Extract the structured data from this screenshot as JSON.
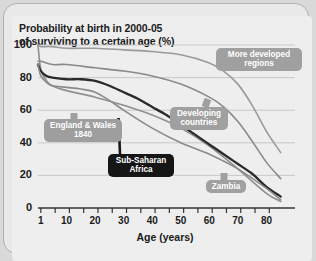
{
  "chart_data": {
    "type": "line",
    "title": "Probability at birth in 2000-05 of surviving to a certain age (%)",
    "title_line1": "Probability at birth in 2000-05",
    "title_line2": "of surviving to a certain age (%)",
    "xlabel": "Age (years)",
    "ylabel": "",
    "xlim": [
      0,
      90
    ],
    "ylim": [
      0,
      100
    ],
    "grid": true,
    "legend_position": "inline-callouts",
    "yticks": [
      0,
      20,
      40,
      60,
      80,
      100
    ],
    "ytick_labels": [
      "0",
      "20",
      "40",
      "60",
      "80",
      "100"
    ],
    "xticks": [
      1,
      10,
      20,
      30,
      40,
      50,
      60,
      70,
      80
    ],
    "xtick_labels": [
      "1",
      "10",
      "20",
      "30",
      "40",
      "50",
      "60",
      "70",
      "80"
    ],
    "series": [
      {
        "name": "More developed regions",
        "color": "#9a9a9a",
        "width": 1.6,
        "x": [
          0,
          1,
          5,
          10,
          20,
          30,
          40,
          50,
          60,
          65,
          70,
          75,
          80,
          85
        ],
        "values": [
          100,
          99,
          99,
          98,
          98,
          97,
          96,
          94,
          89,
          84,
          76,
          63,
          47,
          34
        ]
      },
      {
        "name": "England & Wales 1840",
        "color": "#8f8f8f",
        "width": 1.6,
        "x": [
          0,
          1,
          3,
          5,
          10,
          20,
          30,
          40,
          50,
          60,
          70,
          80,
          85
        ],
        "values": [
          100,
          85,
          78,
          75,
          72,
          68,
          63,
          57,
          49,
          38,
          24,
          9,
          4
        ]
      },
      {
        "name": "Developing countries",
        "color": "#8a8a8a",
        "width": 1.6,
        "x": [
          0,
          1,
          5,
          10,
          20,
          30,
          40,
          50,
          60,
          65,
          70,
          75,
          80,
          85
        ],
        "values": [
          90,
          90,
          88,
          88,
          86,
          84,
          81,
          76,
          68,
          62,
          53,
          41,
          28,
          18
        ]
      },
      {
        "name": "Sub-Saharan Africa",
        "color": "#2a2a2a",
        "width": 2.3,
        "x": [
          0,
          1,
          3,
          5,
          10,
          15,
          20,
          25,
          30,
          35,
          40,
          45,
          50,
          55,
          60,
          65,
          70,
          75,
          80,
          85
        ],
        "values": [
          88,
          84,
          81,
          80,
          79,
          79,
          78,
          75,
          71,
          67,
          62,
          57,
          51,
          45,
          39,
          33,
          27,
          21,
          13,
          7
        ]
      },
      {
        "name": "Zambia",
        "color": "#8a8a8a",
        "width": 1.6,
        "x": [
          0,
          1,
          3,
          5,
          10,
          15,
          20,
          25,
          30,
          40,
          50,
          60,
          70,
          80,
          85
        ],
        "values": [
          88,
          81,
          77,
          75,
          74,
          73,
          71,
          66,
          60,
          49,
          40,
          33,
          24,
          12,
          5
        ]
      }
    ],
    "annotations": [
      {
        "text": "More developed regions",
        "line1": "More developed",
        "line2": "regions"
      },
      {
        "text": "England & Wales 1840",
        "line1": "England & Wales",
        "line2": "1840"
      },
      {
        "text": "Developing countries",
        "line1": "Developing",
        "line2": "countries"
      },
      {
        "text": "Sub-Saharan Africa",
        "line1": "Sub-Saharan",
        "line2": "Africa"
      },
      {
        "text": "Zambia",
        "line1": "Zambia",
        "line2": ""
      }
    ]
  },
  "callouts": {
    "more_developed_l1": "More developed",
    "more_developed_l2": "regions",
    "england_l1": "England & Wales",
    "england_l2": "1840",
    "developing_l1": "Developing",
    "developing_l2": "countries",
    "ssa_l1": "Sub-Saharan",
    "ssa_l2": "Africa",
    "zambia": "Zambia"
  },
  "colors": {
    "background": "#eeeeee",
    "frame_border": "#b0b0b0",
    "grid": "#c4c4c4",
    "axis": "#333333",
    "callout_gray": "#a0a0a0",
    "callout_dark": "#161616",
    "highlight_curve": "#2a2a2a"
  }
}
